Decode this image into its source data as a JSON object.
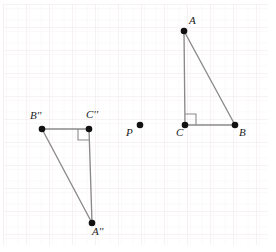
{
  "figure": {
    "width": 276,
    "height": 252,
    "background_color": "#ffffff",
    "grid": {
      "visible": true,
      "major_spacing": 23,
      "minor_spacing": 11.5,
      "major_color": "#f0eaea",
      "minor_color": "#f7f3f3",
      "origin_x": 3,
      "origin_y": 4,
      "left": 3,
      "top": 4,
      "right": 268,
      "bottom": 245
    },
    "style": {
      "segment_color": "#8a8a8a",
      "segment_width": 1.3,
      "point_color": "#111111",
      "point_radius": 3.2,
      "right_angle_color": "#8a8a8a",
      "label_color": "#1c1c1c"
    },
    "points": [
      {
        "id": "A",
        "label": "A",
        "primes": "",
        "x": 184,
        "y": 31,
        "label_x": 191,
        "label_y": 16
      },
      {
        "id": "B",
        "label": "B",
        "primes": "",
        "x": 235,
        "y": 125,
        "label_x": 239,
        "label_y": 129
      },
      {
        "id": "C",
        "label": "C",
        "primes": "",
        "x": 185,
        "y": 125,
        "label_x": 177,
        "label_y": 129
      },
      {
        "id": "P",
        "label": "P",
        "primes": "",
        "x": 140,
        "y": 125,
        "label_x": 127,
        "label_y": 129
      },
      {
        "id": "Bpp",
        "label": "B",
        "primes": "''",
        "x": 42,
        "y": 129,
        "label_x": 31,
        "label_y": 112
      },
      {
        "id": "Cpp",
        "label": "C",
        "primes": "''",
        "x": 89,
        "y": 129,
        "label_x": 88,
        "label_y": 111
      },
      {
        "id": "App",
        "label": "A",
        "primes": "''",
        "x": 92,
        "y": 223,
        "label_x": 93,
        "label_y": 227
      }
    ],
    "triangles": [
      {
        "name": "triangle-ABC",
        "vertices": [
          "A",
          "B",
          "C"
        ],
        "path": "M 184 31 L 235 125 L 185 125 Z",
        "right_angle_at": "C",
        "right_angle_path": "M 185 115 L 195 115 L 195 125"
      },
      {
        "name": "triangle-A2B2C2",
        "vertices": [
          "App",
          "Bpp",
          "Cpp"
        ],
        "path": "M 92 223 L 42 129 L 89 129 Z",
        "right_angle_at": "Cpp",
        "right_angle_path": "M 79 129 L 79 139 L 89 139"
      }
    ],
    "segments": [
      {
        "name": "segment-CA",
        "x1": 185,
        "y1": 125,
        "x2": 184,
        "y2": 31
      },
      {
        "name": "segment-AB",
        "x1": 184,
        "y1": 31,
        "x2": 235,
        "y2": 125
      },
      {
        "name": "segment-CB",
        "x1": 185,
        "y1": 125,
        "x2": 235,
        "y2": 125
      },
      {
        "name": "segment-C2A2",
        "x1": 89,
        "y1": 129,
        "x2": 92,
        "y2": 223
      },
      {
        "name": "segment-A2B2",
        "x1": 92,
        "y1": 223,
        "x2": 42,
        "y2": 129
      },
      {
        "name": "segment-C2B2",
        "x1": 89,
        "y1": 129,
        "x2": 42,
        "y2": 129
      }
    ],
    "center_of_rotation": "P"
  }
}
